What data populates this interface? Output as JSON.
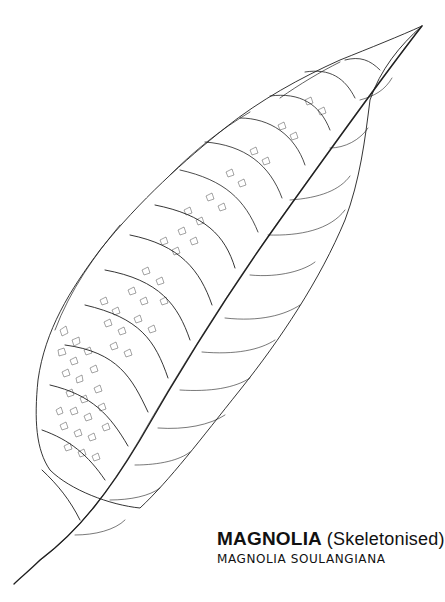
{
  "caption": {
    "title_main": "MAGNOLIA",
    "title_paren": "(Skeletonised)",
    "subtitle": "MAGNOLIA SOULANGIANA"
  },
  "illustration": {
    "subject": "skeletonised-magnolia-leaf",
    "stroke_color": "#1a1a1a",
    "background": "#ffffff"
  }
}
